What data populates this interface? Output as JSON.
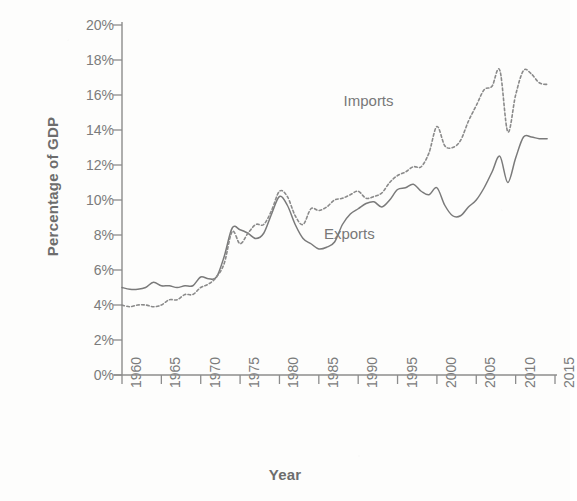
{
  "chart_data": {
    "type": "line",
    "title": "",
    "xlabel": "Year",
    "ylabel": "Percentage of GDP",
    "xlim": [
      1960,
      2015
    ],
    "ylim": [
      0,
      20
    ],
    "grid": false,
    "legend_position": "inline-annotations",
    "y_tick_labels": [
      "20%",
      "18%",
      "16%",
      "14%",
      "12%",
      "10%",
      "8%",
      "6%",
      "4%",
      "2%",
      "0%"
    ],
    "y_tick_values": [
      20,
      18,
      16,
      14,
      12,
      10,
      8,
      6,
      4,
      2,
      0
    ],
    "x_tick_labels": [
      "1960",
      "1965",
      "1970",
      "1975",
      "1980",
      "1985",
      "1990",
      "1995",
      "2000",
      "2005",
      "2010",
      "2015"
    ],
    "x_tick_values": [
      1960,
      1965,
      1970,
      1975,
      1980,
      1985,
      1990,
      1995,
      2000,
      2005,
      2010,
      2015
    ],
    "annotations": [
      {
        "text": "Imports",
        "x": 1995,
        "y": 15.6
      },
      {
        "text": "Exports",
        "x": 1992,
        "y": 8.0
      }
    ],
    "x": [
      1960,
      1961,
      1962,
      1963,
      1964,
      1965,
      1966,
      1967,
      1968,
      1969,
      1970,
      1971,
      1972,
      1973,
      1974,
      1975,
      1976,
      1977,
      1978,
      1979,
      1980,
      1981,
      1982,
      1983,
      1984,
      1985,
      1986,
      1987,
      1988,
      1989,
      1990,
      1991,
      1992,
      1993,
      1994,
      1995,
      1996,
      1997,
      1998,
      1999,
      2000,
      2001,
      2002,
      2003,
      2004,
      2005,
      2006,
      2007,
      2008,
      2009,
      2010,
      2011,
      2012,
      2013,
      2014
    ],
    "series": [
      {
        "name": "Exports",
        "style": "solid",
        "color": "#7a7a7a",
        "values": [
          5.0,
          4.9,
          4.9,
          5.0,
          5.3,
          5.1,
          5.1,
          5.0,
          5.1,
          5.1,
          5.6,
          5.5,
          5.6,
          6.8,
          8.4,
          8.3,
          8.1,
          7.8,
          8.1,
          9.2,
          10.2,
          9.7,
          8.6,
          7.8,
          7.5,
          7.2,
          7.3,
          7.6,
          8.6,
          9.2,
          9.5,
          9.8,
          9.9,
          9.6,
          10.0,
          10.6,
          10.7,
          10.9,
          10.5,
          10.3,
          10.7,
          9.7,
          9.1,
          9.1,
          9.6,
          10.0,
          10.7,
          11.6,
          12.5,
          11.0,
          12.4,
          13.6,
          13.6,
          13.5,
          13.5
        ]
      },
      {
        "name": "Imports",
        "style": "dotted",
        "color": "#8a8a8a",
        "values": [
          4.0,
          3.9,
          4.0,
          4.0,
          3.9,
          4.0,
          4.3,
          4.3,
          4.6,
          4.6,
          5.0,
          5.2,
          5.6,
          6.4,
          8.2,
          7.5,
          8.1,
          8.6,
          8.6,
          9.4,
          10.5,
          10.2,
          9.1,
          8.6,
          9.5,
          9.4,
          9.6,
          10.0,
          10.1,
          10.3,
          10.5,
          10.1,
          10.2,
          10.4,
          11.0,
          11.4,
          11.6,
          11.9,
          11.9,
          12.7,
          14.2,
          13.1,
          13.0,
          13.4,
          14.5,
          15.4,
          16.3,
          16.5,
          17.4,
          13.9,
          16.0,
          17.4,
          17.2,
          16.7,
          16.6
        ]
      }
    ]
  }
}
